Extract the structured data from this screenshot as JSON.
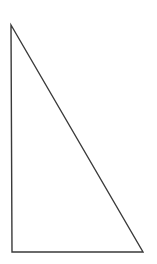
{
  "diagram": {
    "type": "right-triangle",
    "canvas": {
      "width": 157,
      "height": 264,
      "background": "#ffffff"
    },
    "stroke_color": "#3a3a3a",
    "stroke_width": 1.4,
    "fill": "none",
    "vertices": {
      "top": {
        "x": 11,
        "y": 25
      },
      "bottom_left": {
        "x": 12,
        "y": 252
      },
      "bottom_right": {
        "x": 143,
        "y": 252
      }
    },
    "right_angle_at": "bottom_left"
  }
}
